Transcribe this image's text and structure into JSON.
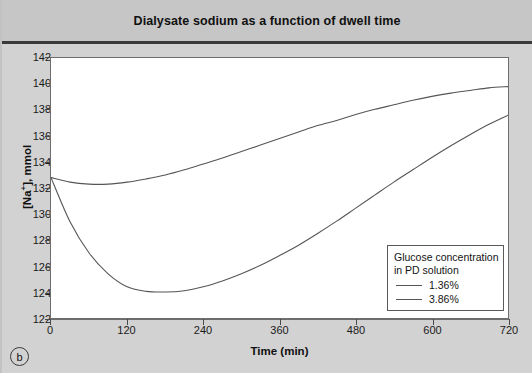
{
  "figure": {
    "title": "Dialysate sodium as a function of dwell time",
    "panel_letter": "b"
  },
  "legend": {
    "heading_line1": "Glucose concentration",
    "heading_line2": "in PD solution",
    "entries": [
      {
        "label": "1.36%",
        "color": "#555555"
      },
      {
        "label": "3.86%",
        "color": "#555555"
      }
    ]
  },
  "axes": {
    "x_title": "Time (min)",
    "y_title_main": "[Na",
    "y_title_sup": "+",
    "y_title_rest": "], mmol",
    "x_ticks": [
      "0",
      "120",
      "240",
      "360",
      "480",
      "600",
      "720"
    ],
    "y_ticks": [
      "122",
      "124",
      "126",
      "128",
      "130",
      "132",
      "134",
      "136",
      "138",
      "140",
      "142"
    ]
  },
  "chart_data": {
    "type": "line",
    "title": "Dialysate sodium as a function of dwell time",
    "xlabel": "Time (min)",
    "ylabel": "[Na+], mmol",
    "xlim": [
      0,
      720
    ],
    "ylim": [
      122,
      142
    ],
    "xticks": [
      0,
      120,
      240,
      360,
      480,
      600,
      720
    ],
    "yticks": [
      122,
      124,
      126,
      128,
      130,
      132,
      134,
      136,
      138,
      140,
      142
    ],
    "grid": false,
    "legend_position": "lower-right",
    "legend_title": "Glucose concentration in PD solution",
    "x": [
      0,
      30,
      60,
      90,
      120,
      150,
      180,
      210,
      240,
      270,
      300,
      330,
      360,
      390,
      420,
      450,
      480,
      510,
      540,
      570,
      600,
      630,
      660,
      690,
      720
    ],
    "series": [
      {
        "name": "1.36%",
        "color": "#555555",
        "values": [
          132.8,
          132.45,
          132.3,
          132.3,
          132.45,
          132.7,
          133.0,
          133.4,
          133.85,
          134.3,
          134.8,
          135.3,
          135.8,
          136.3,
          136.8,
          137.2,
          137.65,
          138.05,
          138.4,
          138.75,
          139.05,
          139.3,
          139.5,
          139.7,
          139.8
        ]
      },
      {
        "name": "3.86%",
        "color": "#555555",
        "values": [
          132.8,
          129.4,
          127.0,
          125.4,
          124.4,
          124.05,
          124.0,
          124.1,
          124.4,
          124.85,
          125.4,
          126.05,
          126.8,
          127.6,
          128.5,
          129.45,
          130.45,
          131.45,
          132.45,
          133.4,
          134.35,
          135.25,
          136.1,
          136.9,
          137.6
        ]
      }
    ]
  }
}
